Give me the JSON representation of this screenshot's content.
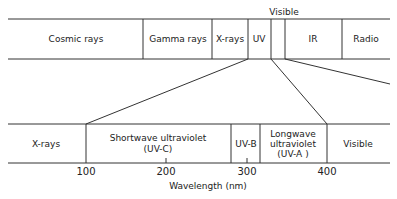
{
  "top_spectrum": {
    "header_label": "Visible",
    "bands": [
      {
        "label": "Cosmic rays"
      },
      {
        "label": "Gamma rays"
      },
      {
        "label": "X-rays"
      },
      {
        "label": "UV"
      },
      {
        "label": ""
      },
      {
        "label": "IR"
      },
      {
        "label": "Radio"
      }
    ]
  },
  "bottom_spectrum": {
    "bands": [
      {
        "label": "X-rays"
      },
      {
        "label": "Shortwave ultraviolet",
        "sub": "(UV-C)"
      },
      {
        "label": "UV-B"
      },
      {
        "label": "Longwave",
        "sub": "ultraviolet",
        "sub2": "(UV-A )"
      },
      {
        "label": "Visible"
      }
    ],
    "ticks": [
      "100",
      "200",
      "300",
      "400"
    ],
    "axis_label": "Wavelength (nm)"
  }
}
